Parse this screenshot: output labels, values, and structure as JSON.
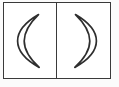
{
  "figure": {
    "background_color": "#ffffff",
    "margin_color": "#fbfbfb",
    "frame": {
      "border_color": "#3a3a3a",
      "border_width_px": 1.6,
      "divider_color": "#3a3a3a",
      "x_px": 3,
      "y_px": 2,
      "width_px": 108,
      "height_px": 77
    },
    "panels": [
      {
        "id": "panel-left",
        "label": "left-panel",
        "icon_name": "crescent-moon-opening-right",
        "description": "Outlined crescent moon, concave side facing right, resembling an opening parenthesis",
        "orientation": "waning",
        "stroke_color": "#2e2e2e",
        "fill_color": "#ffffff",
        "stroke_width_px": 1.7,
        "top_tip_y_px": 17,
        "bottom_tip_y_px": 69,
        "outer_edge_x_px": 22,
        "inner_edge_x_px": 42
      },
      {
        "id": "panel-right",
        "label": "right-panel",
        "icon_name": "crescent-moon-opening-left",
        "description": "Outlined crescent moon, concave side facing left, resembling a closing parenthesis",
        "orientation": "waxing",
        "stroke_color": "#2e2e2e",
        "fill_color": "#ffffff",
        "stroke_width_px": 1.7,
        "top_tip_y_px": 17,
        "bottom_tip_y_px": 69,
        "outer_edge_x_px": 94,
        "inner_edge_x_px": 76
      }
    ],
    "caption": ""
  }
}
